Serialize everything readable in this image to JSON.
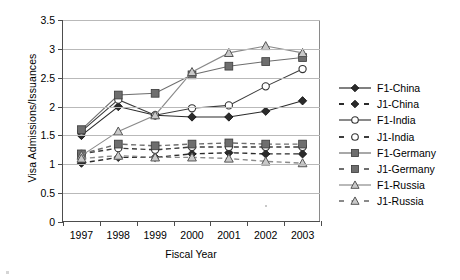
{
  "chart_data": {
    "type": "line",
    "title": "",
    "xlabel": "Fiscal Year",
    "ylabel": "Visa Admissions/Issuances",
    "x": [
      1997,
      1998,
      1999,
      2000,
      2001,
      2002,
      2003
    ],
    "xtick_labels": [
      "1997",
      "1998",
      "1999",
      "2000",
      "2001",
      "2002",
      "2003"
    ],
    "ytick_labels": [
      "0",
      "0.5",
      "1",
      "1.5",
      "2",
      "2.5",
      "3",
      "3.5"
    ],
    "ytick_values": [
      0,
      0.5,
      1,
      1.5,
      2,
      2.5,
      3,
      3.5
    ],
    "ylim": [
      0,
      3.5
    ],
    "grid": "horizontal",
    "legend_position": "right",
    "series": [
      {
        "name": "F1-China",
        "marker": "filled-diamond",
        "line": "solid",
        "color": "#2b2b2b",
        "values": [
          1.5,
          2.0,
          1.85,
          1.82,
          1.82,
          1.92,
          2.1
        ]
      },
      {
        "name": "J1-China",
        "marker": "filled-diamond",
        "line": "dashed",
        "color": "#2b2b2b",
        "values": [
          1.02,
          1.12,
          1.12,
          1.18,
          1.2,
          1.18,
          1.18
        ]
      },
      {
        "name": "F1-India",
        "marker": "open-circle",
        "line": "solid",
        "color": "#3c3c3c",
        "values": [
          1.57,
          2.12,
          1.85,
          1.97,
          2.02,
          2.35,
          2.65
        ]
      },
      {
        "name": "J1-India",
        "marker": "open-circle",
        "line": "dashed",
        "color": "#3c3c3c",
        "values": [
          1.18,
          1.28,
          1.25,
          1.3,
          1.3,
          1.3,
          1.3
        ]
      },
      {
        "name": "F1-Germany",
        "marker": "filled-square",
        "line": "solid",
        "color": "#6e6e6e",
        "values": [
          1.6,
          2.2,
          2.23,
          2.55,
          2.7,
          2.78,
          2.85
        ]
      },
      {
        "name": "J1-Germany",
        "marker": "filled-square",
        "line": "dashed",
        "color": "#6e6e6e",
        "values": [
          1.18,
          1.35,
          1.32,
          1.35,
          1.37,
          1.35,
          1.35
        ]
      },
      {
        "name": "F1-Russia",
        "marker": "open-triangle",
        "line": "solid",
        "color": "#8a8a8a",
        "values": [
          1.15,
          1.57,
          1.85,
          2.6,
          2.93,
          3.05,
          2.93
        ]
      },
      {
        "name": "J1-Russia",
        "marker": "open-triangle",
        "line": "dashed",
        "color": "#8a8a8a",
        "values": [
          1.1,
          1.15,
          1.12,
          1.12,
          1.1,
          1.05,
          1.02
        ]
      }
    ]
  }
}
